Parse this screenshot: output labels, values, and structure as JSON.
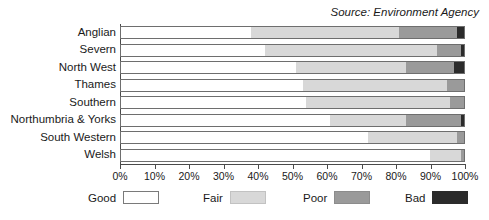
{
  "source_note": "Source: Environment Agency",
  "legend": {
    "items": [
      {
        "label": "Good",
        "color": "#ffffff",
        "left": 88
      },
      {
        "label": "Fair",
        "color": "#d8d8d8",
        "left": 203
      },
      {
        "label": "Poor",
        "color": "#9a9a9a",
        "left": 303
      },
      {
        "label": "Bad",
        "color": "#2b2b2b",
        "left": 405
      }
    ]
  },
  "chart_data": {
    "type": "bar",
    "orientation": "horizontal",
    "stacked": true,
    "stack_total": 100,
    "title": "",
    "subtitle": "",
    "annotations": [
      "Source: Environment Agency"
    ],
    "xlabel": "",
    "ylabel": "",
    "xlim": [
      0,
      100
    ],
    "xticks": [
      0,
      10,
      20,
      30,
      40,
      50,
      60,
      70,
      80,
      90,
      100
    ],
    "xticklabels": [
      "0%",
      "10%",
      "20%",
      "30%",
      "40%",
      "50%",
      "60%",
      "70%",
      "80%",
      "90%",
      "100%"
    ],
    "grid": false,
    "legend_position": "bottom",
    "categories": [
      "Anglian",
      "Severn",
      "North West",
      "Thames",
      "Southern",
      "Northumbria & Yorks",
      "South Western",
      "Welsh"
    ],
    "series": [
      {
        "name": "Good",
        "color": "#ffffff",
        "values": [
          38,
          42,
          51,
          53,
          54,
          61,
          72,
          90
        ]
      },
      {
        "name": "Fair",
        "color": "#d8d8d8",
        "values": [
          43,
          50,
          32,
          42,
          42,
          22,
          26,
          9
        ]
      },
      {
        "name": "Poor",
        "color": "#9a9a9a",
        "values": [
          17,
          7,
          14,
          5,
          4,
          16,
          2,
          1
        ]
      },
      {
        "name": "Bad",
        "color": "#2b2b2b",
        "values": [
          2,
          1,
          3,
          0,
          0,
          1,
          0,
          0
        ]
      }
    ]
  }
}
